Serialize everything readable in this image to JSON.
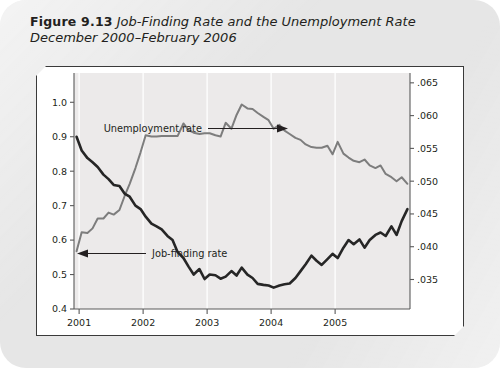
{
  "caption": {
    "figure_number": "Figure 9.13",
    "title_line1": "Job-Finding Rate and the Unemployment Rate",
    "title_line2": "December 2000–February 2006"
  },
  "colors": {
    "card_background": "#e6e6e6",
    "panel_background": "#ffffff",
    "plot_background": "#eceaea",
    "panel_border": "#3a3a3a",
    "unemployment_line": "#7d7d7d",
    "jobfinding_line": "#262626",
    "gridline": "#fbfbfb",
    "text": "#231f20"
  },
  "chart_data": {
    "type": "line",
    "title": "Job-Finding Rate and the Unemployment Rate",
    "subtitle": "December 2000–February 2006",
    "xlabel": "",
    "ylabel": "",
    "grid": true,
    "legend_position": "inline-annotations",
    "x_axis": {
      "tick_labels": [
        "2001",
        "2002",
        "2003",
        "2004",
        "2005"
      ],
      "tick_values": [
        2001,
        2002,
        2003,
        2004,
        2005
      ],
      "range": [
        2000.92,
        2006.17
      ]
    },
    "y_axis_left": {
      "label": "Job-finding rate",
      "tick_labels": [
        "0.4",
        "0.5",
        "0.6",
        "0.7",
        "0.8",
        "0.9",
        "1.0"
      ],
      "tick_values": [
        0.4,
        0.5,
        0.6,
        0.7,
        0.8,
        0.9,
        1.0
      ],
      "range": [
        0.4,
        1.085
      ]
    },
    "y_axis_right": {
      "label": "Unemployment rate",
      "tick_labels": [
        ".035",
        ".040",
        ".045",
        ".050",
        ".055",
        ".060",
        ".065"
      ],
      "tick_values": [
        0.035,
        0.04,
        0.045,
        0.05,
        0.055,
        0.06,
        0.065
      ],
      "range": [
        0.0305,
        0.0665
      ]
    },
    "annotations": [
      {
        "text": "Unemployment rate",
        "arrow": "right"
      },
      {
        "text": "Job-finding rate",
        "arrow": "left"
      }
    ],
    "series": [
      {
        "name": "Unemployment rate",
        "axis": "right",
        "color": "#7d7d7d",
        "x": [
          2000.96,
          2001.04,
          2001.13,
          2001.21,
          2001.29,
          2001.38,
          2001.46,
          2001.54,
          2001.63,
          2001.71,
          2001.79,
          2001.88,
          2001.96,
          2002.04,
          2002.13,
          2002.21,
          2002.29,
          2002.38,
          2002.46,
          2002.54,
          2002.63,
          2002.71,
          2002.79,
          2002.88,
          2002.96,
          2003.04,
          2003.13,
          2003.21,
          2003.29,
          2003.38,
          2003.46,
          2003.54,
          2003.63,
          2003.71,
          2003.79,
          2003.88,
          2003.96,
          2004.04,
          2004.13,
          2004.21,
          2004.29,
          2004.38,
          2004.46,
          2004.54,
          2004.63,
          2004.71,
          2004.79,
          2004.88,
          2004.96,
          2005.04,
          2005.13,
          2005.21,
          2005.29,
          2005.38,
          2005.46,
          2005.54,
          2005.63,
          2005.71,
          2005.79,
          2005.88,
          2005.96,
          2006.04,
          2006.13
        ],
        "y": [
          0.0393,
          0.0422,
          0.0421,
          0.0428,
          0.0443,
          0.0443,
          0.0452,
          0.0449,
          0.0456,
          0.0477,
          0.0496,
          0.052,
          0.0544,
          0.057,
          0.0568,
          0.0568,
          0.0569,
          0.0569,
          0.0569,
          0.0569,
          0.0588,
          0.0578,
          0.0574,
          0.0572,
          0.0573,
          0.0573,
          0.057,
          0.0568,
          0.0589,
          0.058,
          0.0601,
          0.0617,
          0.0611,
          0.061,
          0.0604,
          0.0598,
          0.0593,
          0.058,
          0.0586,
          0.0577,
          0.0572,
          0.0566,
          0.0563,
          0.0556,
          0.0552,
          0.0551,
          0.0551,
          0.0554,
          0.0541,
          0.056,
          0.0542,
          0.0536,
          0.0531,
          0.0529,
          0.0533,
          0.0524,
          0.052,
          0.0524,
          0.0511,
          0.0506,
          0.05,
          0.0506,
          0.0496
        ],
        "start_value": 0.0393,
        "peak_value": 0.0617,
        "end_value": 0.0496
      },
      {
        "name": "Job-finding rate",
        "axis": "left",
        "color": "#262626",
        "x": [
          2000.96,
          2001.04,
          2001.13,
          2001.21,
          2001.29,
          2001.38,
          2001.46,
          2001.54,
          2001.63,
          2001.71,
          2001.79,
          2001.88,
          2001.96,
          2002.04,
          2002.13,
          2002.21,
          2002.29,
          2002.38,
          2002.46,
          2002.54,
          2002.63,
          2002.71,
          2002.79,
          2002.88,
          2002.96,
          2003.04,
          2003.13,
          2003.21,
          2003.29,
          2003.38,
          2003.46,
          2003.54,
          2003.63,
          2003.71,
          2003.79,
          2003.88,
          2003.96,
          2004.04,
          2004.13,
          2004.21,
          2004.29,
          2004.38,
          2004.46,
          2004.54,
          2004.63,
          2004.71,
          2004.79,
          2004.88,
          2004.96,
          2005.04,
          2005.13,
          2005.21,
          2005.29,
          2005.38,
          2005.46,
          2005.54,
          2005.63,
          2005.71,
          2005.79,
          2005.88,
          2005.96,
          2006.04,
          2006.13
        ],
        "y": [
          0.9,
          0.86,
          0.838,
          0.826,
          0.812,
          0.79,
          0.777,
          0.76,
          0.757,
          0.735,
          0.726,
          0.7,
          0.69,
          0.668,
          0.648,
          0.64,
          0.631,
          0.612,
          0.6,
          0.565,
          0.548,
          0.523,
          0.5,
          0.516,
          0.487,
          0.5,
          0.498,
          0.488,
          0.494,
          0.51,
          0.497,
          0.52,
          0.5,
          0.49,
          0.473,
          0.47,
          0.468,
          0.462,
          0.468,
          0.472,
          0.474,
          0.49,
          0.51,
          0.53,
          0.555,
          0.54,
          0.528,
          0.545,
          0.56,
          0.548,
          0.578,
          0.6,
          0.588,
          0.602,
          0.578,
          0.6,
          0.615,
          0.622,
          0.612,
          0.64,
          0.615,
          0.655,
          0.69
        ],
        "start_value": 0.9,
        "trough_value": 0.462,
        "end_value": 0.69
      }
    ]
  }
}
